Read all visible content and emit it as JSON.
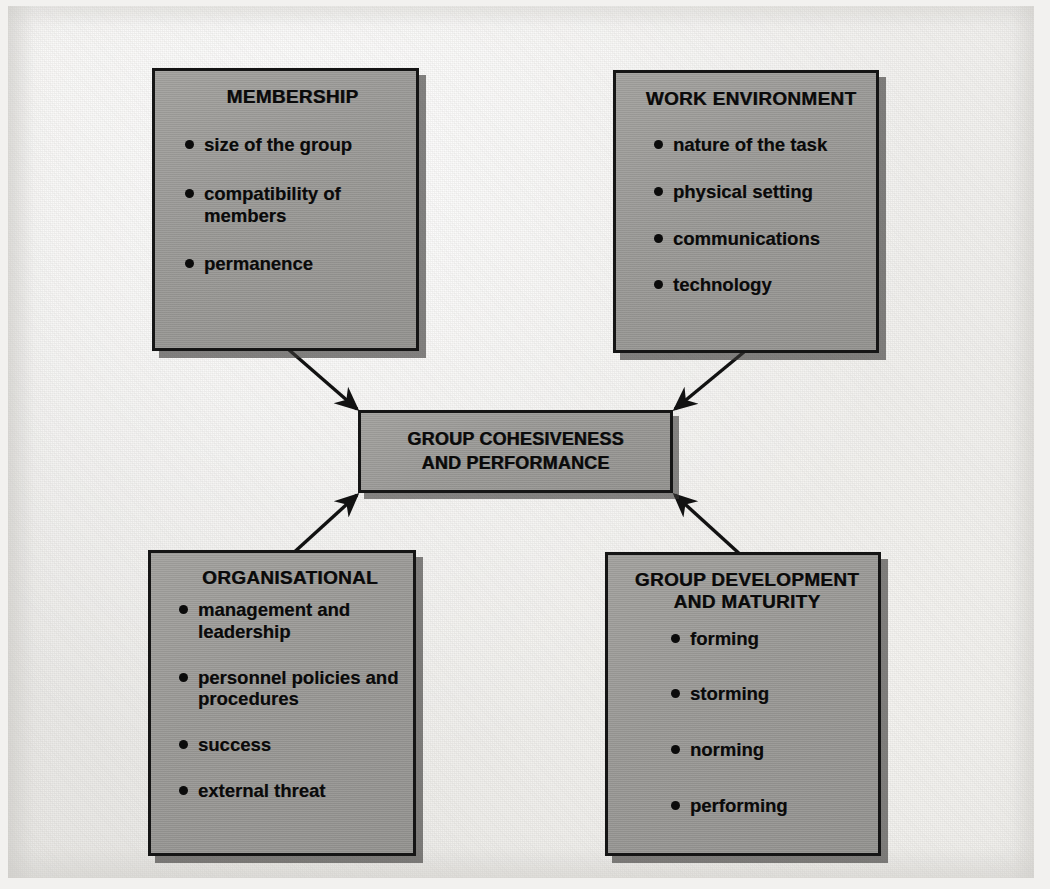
{
  "diagram": {
    "type": "influence-diagram",
    "center": {
      "id": "group-cohesiveness-and-performance",
      "title_line1": "GROUP COHESIVENESS",
      "title_line2": "AND PERFORMANCE"
    },
    "nodes": [
      {
        "id": "membership",
        "title": "MEMBERSHIP",
        "position": "top-left",
        "items": [
          "size of the group",
          "compatibility of members",
          "permanence"
        ]
      },
      {
        "id": "work-environment",
        "title": "WORK ENVIRONMENT",
        "position": "top-right",
        "items": [
          "nature of the task",
          "physical setting",
          "communications",
          "technology"
        ]
      },
      {
        "id": "organisational",
        "title": "ORGANISATIONAL",
        "position": "bottom-left",
        "items": [
          "management and leadership",
          "personnel policies and procedures",
          "success",
          "external threat"
        ]
      },
      {
        "id": "group-development",
        "title_line1": "GROUP DEVELOPMENT",
        "title_line2": "AND MATURITY",
        "position": "bottom-right",
        "items": [
          "forming",
          "storming",
          "norming",
          "performing"
        ]
      }
    ],
    "connectors": [
      {
        "from": "membership",
        "to": "group-cohesiveness-and-performance",
        "style": "solid-arrow"
      },
      {
        "from": "work-environment",
        "to": "group-cohesiveness-and-performance",
        "style": "solid-arrow"
      },
      {
        "from": "organisational",
        "to": "group-cohesiveness-and-performance",
        "style": "solid-arrow"
      },
      {
        "from": "group-development",
        "to": "group-cohesiveness-and-performance",
        "style": "solid-arrow"
      }
    ],
    "colors": {
      "box_fill": "#9a9996",
      "box_border": "#151515",
      "shadow": "#3a3937",
      "paper": "#f0efec",
      "text": "#0a0a0a"
    }
  }
}
